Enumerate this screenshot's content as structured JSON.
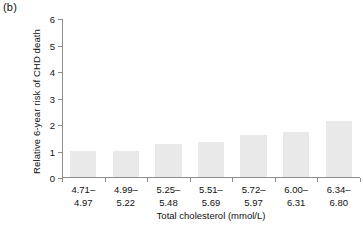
{
  "panel": {
    "label": "(b)"
  },
  "chart_data": {
    "type": "bar",
    "title": "",
    "subtitle": "",
    "xlabel": "Total cholesterol (mmol/L)",
    "ylabel": "Relative 6-year risk of CHD death",
    "categories": [
      "4.71–\n4.97",
      "4.99–\n5.22",
      "5.25–\n5.48",
      "5.51–\n5.69",
      "5.72–\n5.97",
      "6.00–\n6.31",
      "6.34–\n6.80"
    ],
    "category_lines": [
      [
        "4.71–",
        "4.97"
      ],
      [
        "4.99–",
        "5.22"
      ],
      [
        "5.25–",
        "5.48"
      ],
      [
        "5.51–",
        "5.69"
      ],
      [
        "5.72–",
        "5.97"
      ],
      [
        "6.00–",
        "6.31"
      ],
      [
        "6.34–",
        "6.80"
      ]
    ],
    "values": [
      1.0,
      1.0,
      1.25,
      1.33,
      1.6,
      1.7,
      2.1
    ],
    "ylim": [
      0,
      6
    ],
    "yticks": [
      0,
      1,
      2,
      3,
      4,
      5,
      6
    ],
    "ytick_labels": [
      "0",
      "1",
      "2",
      "3",
      "4",
      "5",
      "6"
    ],
    "grid": false,
    "legend": "none",
    "bar_color": "#e9e9e9",
    "axis_color": "#8c8c8c"
  }
}
